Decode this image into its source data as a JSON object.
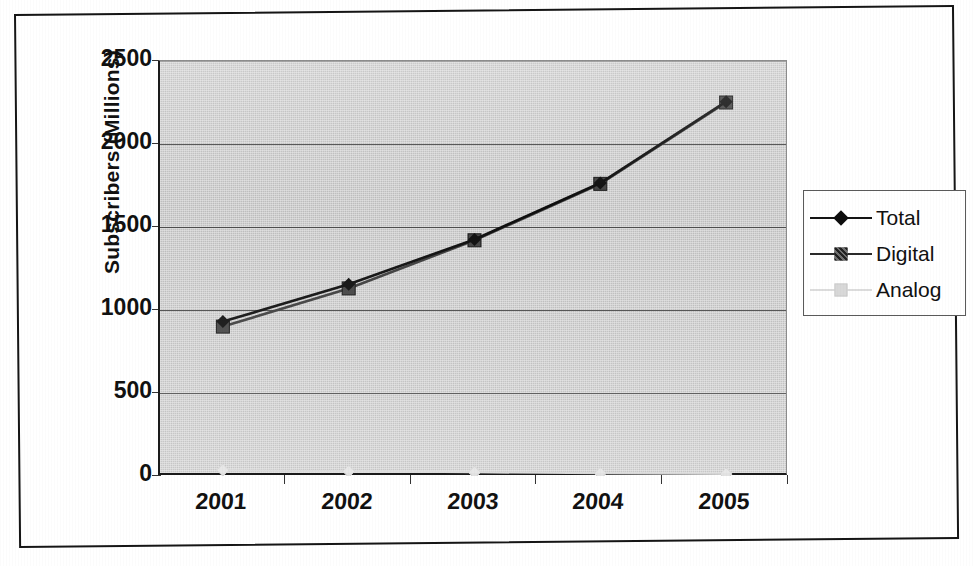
{
  "chart_data": {
    "type": "line",
    "title": "",
    "xlabel": "",
    "ylabel": "Subscribers (Millions)",
    "categories": [
      "2001",
      "2002",
      "2003",
      "2004",
      "2005"
    ],
    "x_tick_labels": [
      "2001",
      "2002",
      "2003",
      "2004",
      "2005"
    ],
    "y_tick_labels": [
      "0",
      "500",
      "1000",
      "1500",
      "2000",
      "2500"
    ],
    "y_ticks": [
      0,
      500,
      1000,
      1500,
      2000,
      2500
    ],
    "ylim": [
      0,
      2500
    ],
    "grid": "horizontal",
    "legend_position": "right",
    "series": [
      {
        "name": "Total",
        "marker": "diamond",
        "color": "#0d0d0d",
        "values": [
          930,
          1155,
          1425,
          1765,
          2255
        ]
      },
      {
        "name": "Digital",
        "marker": "square",
        "color": "#3d3d3d",
        "values": [
          900,
          1130,
          1420,
          1760,
          2250
        ]
      },
      {
        "name": "Analog",
        "marker": "faint",
        "color": "#d5d5d5",
        "values": [
          35,
          28,
          22,
          16,
          12
        ]
      }
    ]
  },
  "legend": {
    "items": [
      {
        "label": "Total"
      },
      {
        "label": "Digital"
      },
      {
        "label": "Analog"
      }
    ]
  },
  "axes": {
    "y_title": "Subscribers (Millions)"
  }
}
